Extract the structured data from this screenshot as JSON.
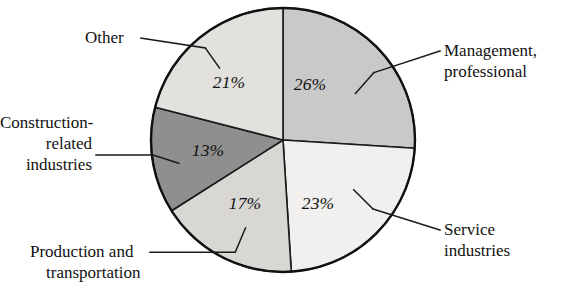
{
  "chart_data": {
    "type": "pie",
    "title": "",
    "subtitle": "",
    "xlabel": "",
    "ylabel": "",
    "legend_position": "callout-labels",
    "grid": false,
    "units": "percent",
    "total": 100,
    "categories": [
      "Management, professional",
      "Service industries",
      "Production and transportation",
      "Construction-related industries",
      "Other"
    ],
    "values": [
      26,
      23,
      17,
      13,
      21
    ],
    "value_labels": [
      "26%",
      "23%",
      "17%",
      "13%",
      "21%"
    ],
    "colors": [
      "#c9c9c9",
      "#f1f0ee",
      "#d8d7d4",
      "#8f8f8f",
      "#e2e1de"
    ],
    "start_angle_deg": 0,
    "direction": "clockwise",
    "slices": [
      {
        "name": "Management, professional",
        "value": 26,
        "label": "26%",
        "color": "#c9c9c9",
        "start_deg": 0,
        "end_deg": 93.6,
        "callout_lines": [
          "Management,",
          "professional"
        ]
      },
      {
        "name": "Service industries",
        "value": 23,
        "label": "23%",
        "color": "#f1f0ee",
        "start_deg": 93.6,
        "end_deg": 176.4,
        "callout_lines": [
          "Service",
          "industries"
        ]
      },
      {
        "name": "Production and transportation",
        "value": 17,
        "label": "17%",
        "color": "#d8d7d4",
        "start_deg": 176.4,
        "end_deg": 237.6,
        "callout_lines": [
          "Production and",
          "transportation"
        ]
      },
      {
        "name": "Construction-related industries",
        "value": 13,
        "label": "13%",
        "color": "#8f8f8f",
        "start_deg": 237.6,
        "end_deg": 284.4,
        "callout_lines": [
          "Construction-",
          "related",
          "industries"
        ]
      },
      {
        "name": "Other",
        "value": 21,
        "label": "21%",
        "color": "#e2e1de",
        "start_deg": 284.4,
        "end_deg": 360,
        "callout_lines": [
          "Other"
        ]
      }
    ]
  },
  "pct_labels": {
    "management": "26%",
    "service": "23%",
    "production": "17%",
    "construction": "13%",
    "other": "21%"
  },
  "callouts": {
    "management": {
      "line1": "Management,",
      "line2": "professional"
    },
    "service": {
      "line1": "Service",
      "line2": "industries"
    },
    "production": {
      "line1": "Production and",
      "line2": "transportation"
    },
    "construction": {
      "line1": "Construction-",
      "line2": "related",
      "line3": "industries"
    },
    "other": {
      "line1": "Other"
    }
  }
}
